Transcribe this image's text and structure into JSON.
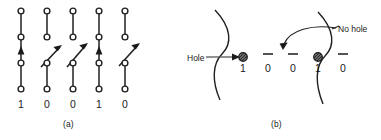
{
  "figure": {
    "panels": [
      {
        "id": "a",
        "caption": "(a)",
        "type": "core-line-diagram",
        "columns": [
          {
            "index": 0,
            "label": "1",
            "state": "up-arrow",
            "arrow": "vertical-up",
            "x": 21
          },
          {
            "index": 1,
            "label": "0",
            "state": "diagonal-arrow",
            "arrow": "diagonal-up-right",
            "x": 47
          },
          {
            "index": 2,
            "label": "0",
            "state": "diagonal-arrow",
            "arrow": "diagonal-up-right",
            "x": 73
          },
          {
            "index": 3,
            "label": "1",
            "state": "up-arrow",
            "arrow": "vertical-up",
            "x": 99
          },
          {
            "index": 4,
            "label": "0",
            "state": "diagonal-arrow",
            "arrow": "diagonal-up-right",
            "x": 125
          }
        ],
        "bit_string": "1 0 0 1 0",
        "node_count_per_column": 4
      },
      {
        "id": "b",
        "caption": "(b)",
        "type": "punched-card-hole-diagram",
        "annotations": [
          {
            "name": "hole",
            "text": "Hole",
            "arrow": "straight-right",
            "target_digit_index": 0
          },
          {
            "name": "no-hole",
            "text": "No hole",
            "arrow": "curved-left",
            "target_digit_index": 2
          }
        ],
        "cells": [
          {
            "index": 0,
            "label": "1",
            "marker": "filled-dot",
            "x": 243
          },
          {
            "index": 1,
            "label": "0",
            "marker": "dash",
            "x": 268
          },
          {
            "index": 2,
            "label": "0",
            "marker": "dash",
            "x": 293
          },
          {
            "index": 3,
            "label": "1",
            "marker": "filled-dot",
            "x": 318
          },
          {
            "index": 4,
            "label": "0",
            "marker": "dash",
            "x": 343
          }
        ],
        "bit_string": "1 0 0 1 0",
        "curves": [
          "left-s-curve",
          "right-s-curve"
        ]
      }
    ]
  },
  "colors": {
    "ink": "#1a1a1a",
    "stroke": "#202020",
    "dot_fill": "#5a5a5a",
    "background": "#ffffff"
  }
}
